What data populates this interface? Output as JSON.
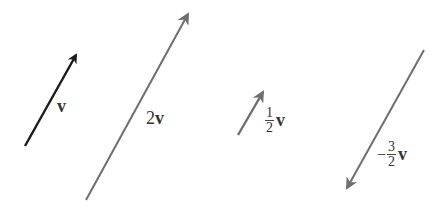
{
  "colors": {
    "v": "#1a1a1a",
    "scaled": "#6e6e6e"
  },
  "vectors": [
    {
      "id": "v",
      "label": "v",
      "scale": "1",
      "x1": 25,
      "y1": 146,
      "x2": 78,
      "y2": 52,
      "color": "#1a1a1a"
    },
    {
      "id": "2v",
      "label_coef": "2",
      "label_var": "v",
      "scale": "2",
      "x1": 86,
      "y1": 200,
      "x2": 190,
      "y2": 10,
      "color": "#6e6e6e"
    },
    {
      "id": "half-v",
      "label_num": "1",
      "label_den": "2",
      "label_var": "v",
      "scale": "1/2",
      "x1": 238,
      "y1": 135,
      "x2": 265,
      "y2": 88,
      "color": "#6e6e6e"
    },
    {
      "id": "neg-three-halves-v",
      "label_sign": "−",
      "label_num": "3",
      "label_den": "2",
      "label_var": "v",
      "scale": "-3/2",
      "x1": 424,
      "y1": 50,
      "x2": 345,
      "y2": 192,
      "color": "#6e6e6e"
    }
  ]
}
